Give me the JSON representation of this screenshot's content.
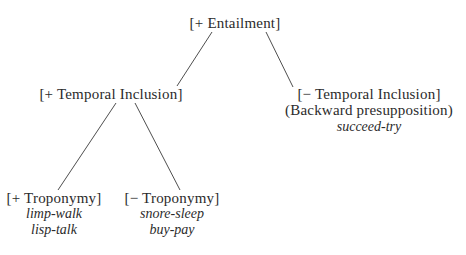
{
  "diagram": {
    "type": "tree",
    "root": {
      "id": "entailment",
      "label": "[+ Entailment]"
    },
    "temporal_inclusion_pos": {
      "id": "temporal-inclusion-plus",
      "label": "[+ Temporal Inclusion]"
    },
    "temporal_inclusion_neg": {
      "id": "temporal-inclusion-minus",
      "label": "[− Temporal Inclusion]",
      "sublabel": "(Backward presupposition)",
      "examples": [
        "succeed-try"
      ]
    },
    "troponymy_pos": {
      "id": "troponymy-plus",
      "label": "[+ Troponymy]",
      "examples": [
        "limp-walk",
        "lisp-talk"
      ]
    },
    "troponymy_neg": {
      "id": "troponymy-minus",
      "label": "[− Troponymy]",
      "examples": [
        "snore-sleep",
        "buy-pay"
      ]
    },
    "edges": [
      {
        "from": "entailment",
        "to": "temporal-inclusion-plus"
      },
      {
        "from": "entailment",
        "to": "temporal-inclusion-minus"
      },
      {
        "from": "temporal-inclusion-plus",
        "to": "troponymy-plus"
      },
      {
        "from": "temporal-inclusion-plus",
        "to": "troponymy-minus"
      }
    ],
    "colors": {
      "text": "#2b2b2b",
      "line": "#3a3a3a",
      "background": "#ffffff"
    }
  }
}
